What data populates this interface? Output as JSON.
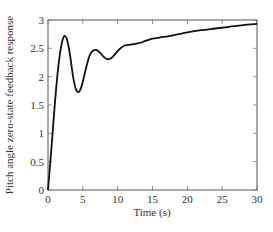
{
  "chart_data": {
    "type": "line",
    "title": "",
    "xlabel": "Time (s)",
    "ylabel": "Pitch angle zero-state feedback response",
    "xlim": [
      0,
      30
    ],
    "ylim": [
      0,
      3
    ],
    "xticks": [
      0,
      5,
      10,
      15,
      20,
      25,
      30
    ],
    "yticks": [
      0,
      0.5,
      1,
      1.5,
      2,
      2.5,
      3
    ],
    "xtick_labels": [
      "0",
      "5",
      "10",
      "15",
      "20",
      "25",
      "30"
    ],
    "ytick_labels": [
      "0",
      "0.5",
      "1",
      "1.5",
      "2",
      "2.5",
      "3"
    ],
    "grid": false,
    "legend": null,
    "series": [
      {
        "name": "response",
        "color": "#111111",
        "x": [
          0,
          0.5,
          1.0,
          1.5,
          2.0,
          2.4,
          2.8,
          3.2,
          3.6,
          4.0,
          4.4,
          4.8,
          5.2,
          5.6,
          6.0,
          6.5,
          7.0,
          7.5,
          8.0,
          8.5,
          9.0,
          9.5,
          10.0,
          10.5,
          11.0,
          11.5,
          12.0,
          13.0,
          14.0,
          15.0,
          16.0,
          18.0,
          20.0,
          22.0,
          24.0,
          26.0,
          28.0,
          30.0
        ],
        "values": [
          0,
          0.75,
          1.55,
          2.2,
          2.6,
          2.72,
          2.62,
          2.35,
          2.0,
          1.78,
          1.73,
          1.82,
          2.02,
          2.22,
          2.38,
          2.46,
          2.47,
          2.42,
          2.35,
          2.31,
          2.32,
          2.38,
          2.45,
          2.51,
          2.55,
          2.56,
          2.57,
          2.59,
          2.63,
          2.67,
          2.69,
          2.73,
          2.78,
          2.82,
          2.85,
          2.88,
          2.91,
          2.93
        ]
      }
    ]
  }
}
